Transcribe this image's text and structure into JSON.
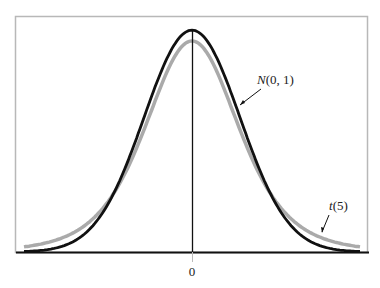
{
  "chart_data": {
    "type": "line",
    "title": "",
    "xlabel": "",
    "ylabel": "",
    "x_ticks": [
      "0"
    ],
    "xlim": [
      -3.5,
      3.5
    ],
    "grid": false,
    "legend": "inline annotations",
    "series": [
      {
        "name": "N(0, 1)",
        "label_main": "N",
        "label_args": "(0, 1)",
        "distribution": "standard normal",
        "peak": 0.399,
        "color": "#111111",
        "width": 3
      },
      {
        "name": "t(5)",
        "label_main": "t",
        "label_args": "(5)",
        "distribution": "Student t, 5 df",
        "peak": 0.38,
        "color": "#aaaaaa",
        "width": 3.5
      }
    ]
  },
  "labels": {
    "normal": "N",
    "normal_args": "(0, 1)",
    "t": "t",
    "t_args": "(5)",
    "zero_tick": "0"
  }
}
